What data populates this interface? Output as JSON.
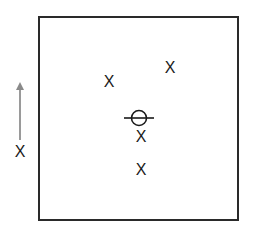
{
  "diagram": {
    "type": "position-diagram",
    "frame": {
      "shape": "square"
    },
    "direction_indicator": {
      "label": "X",
      "arrow_direction": "up",
      "arrow_color": "#9a9a9a"
    },
    "markers": [
      {
        "label": "X",
        "x": 109,
        "y": 82
      },
      {
        "label": "X",
        "x": 170,
        "y": 68
      },
      {
        "label": "X",
        "x": 141,
        "y": 137
      },
      {
        "label": "X",
        "x": 141,
        "y": 170
      }
    ],
    "reference_symbol": {
      "shape": "circle-with-horizontal-line",
      "cx": 139,
      "cy": 118
    }
  }
}
